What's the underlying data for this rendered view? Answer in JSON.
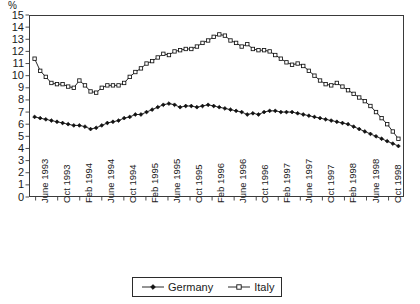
{
  "chart_data": {
    "type": "line",
    "title": "",
    "xlabel": "",
    "ylabel": "%",
    "ylim": [
      0,
      15
    ],
    "ytick_values": [
      0,
      1,
      2,
      3,
      4,
      5,
      6,
      7,
      8,
      9,
      10,
      11,
      12,
      13,
      14,
      15
    ],
    "ytick_labels": [
      "0",
      "1",
      "2",
      "3",
      "4",
      "5",
      "6",
      "7",
      "8",
      "9",
      "10",
      "11",
      "12",
      "13",
      "14",
      "15"
    ],
    "grid": false,
    "legend_position": "bottom-center",
    "xtick_labels": [
      "June 1993",
      "Oct 1993",
      "Feb 1994",
      "June 1994",
      "Oct 1994",
      "Feb 1995",
      "June 1995",
      "Oct 1995",
      "Feb 1996",
      "June 1996",
      "Oct 1996",
      "Feb 1997",
      "June 1997",
      "Oct 1997",
      "Feb 1998",
      "June 1998",
      "Oct 1998"
    ],
    "x_interval_months": 4,
    "x_start": "June 1993",
    "x_end": "November 1998",
    "n_points": 66,
    "series": [
      {
        "name": "Germany",
        "marker": "filled-diamond",
        "color": "#111111",
        "values": [
          6.6,
          6.5,
          6.4,
          6.3,
          6.2,
          6.1,
          6.0,
          5.9,
          5.9,
          5.8,
          5.6,
          5.7,
          5.9,
          6.1,
          6.2,
          6.3,
          6.5,
          6.6,
          6.8,
          6.8,
          7.0,
          7.2,
          7.4,
          7.6,
          7.7,
          7.6,
          7.4,
          7.5,
          7.5,
          7.4,
          7.5,
          7.6,
          7.5,
          7.4,
          7.3,
          7.2,
          7.1,
          7.0,
          6.8,
          6.9,
          6.8,
          7.0,
          7.1,
          7.1,
          7.0,
          7.0,
          7.0,
          6.9,
          6.8,
          6.7,
          6.6,
          6.5,
          6.4,
          6.3,
          6.2,
          6.1,
          6.0,
          5.8,
          5.6,
          5.4,
          5.2,
          5.0,
          4.8,
          4.6,
          4.4,
          4.2
        ]
      },
      {
        "name": "Italy",
        "marker": "open-square",
        "color": "#111111",
        "values": [
          11.4,
          10.4,
          9.9,
          9.4,
          9.3,
          9.3,
          9.1,
          9.0,
          9.6,
          9.2,
          8.7,
          8.6,
          9.0,
          9.2,
          9.2,
          9.2,
          9.4,
          9.9,
          10.3,
          10.6,
          11.0,
          11.2,
          11.5,
          11.8,
          11.7,
          12.0,
          12.1,
          12.2,
          12.2,
          12.4,
          12.7,
          12.9,
          13.2,
          13.4,
          13.3,
          12.9,
          12.7,
          12.4,
          12.6,
          12.2,
          12.1,
          12.1,
          12.0,
          11.7,
          11.4,
          11.1,
          10.9,
          11.0,
          10.8,
          10.4,
          10.0,
          9.6,
          9.3,
          9.2,
          9.4,
          9.1,
          8.8,
          8.5,
          8.2,
          7.9,
          7.5,
          7.0,
          6.5,
          6.0,
          5.4,
          4.8
        ]
      }
    ]
  },
  "legend": {
    "items": [
      {
        "label": "Germany",
        "marker": "filled-diamond"
      },
      {
        "label": "Italy",
        "marker": "open-square"
      }
    ]
  }
}
